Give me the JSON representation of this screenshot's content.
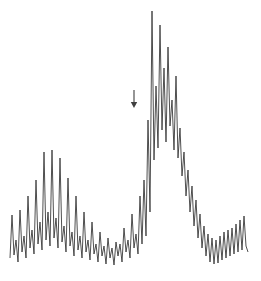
{
  "figure": {
    "title": "",
    "background_color": "#ffffff",
    "trace_color": "#3b3b3b",
    "annotation_color": "#3f3f3f",
    "width": 261,
    "height": 281
  },
  "annotations": [
    {
      "name": "peak-marker-arrow",
      "symbol": "down-arrow",
      "label": "",
      "x": 134,
      "y_top": 90,
      "y_bottom": 108
    }
  ],
  "chart_data": {
    "type": "line",
    "title": "",
    "subtitle": "",
    "xlabel": "",
    "ylabel": "",
    "legend": [],
    "legend_position": "none",
    "grid": false,
    "axis_visible": false,
    "xlim": [
      0,
      260
    ],
    "ylim": [
      0,
      281
    ],
    "x": [
      10,
      12,
      14,
      16,
      18,
      20,
      22,
      24,
      26,
      28,
      30,
      32,
      34,
      36,
      38,
      40,
      42,
      44,
      46,
      48,
      50,
      52,
      54,
      56,
      58,
      60,
      62,
      64,
      66,
      68,
      70,
      72,
      74,
      76,
      78,
      80,
      82,
      84,
      86,
      88,
      90,
      92,
      94,
      96,
      98,
      100,
      102,
      104,
      106,
      108,
      110,
      112,
      114,
      116,
      118,
      120,
      122,
      124,
      126,
      128,
      130,
      132,
      134,
      136,
      138,
      140,
      142,
      144,
      146,
      148,
      150,
      152,
      154,
      156,
      158,
      160,
      162,
      164,
      166,
      168,
      170,
      172,
      174,
      176,
      178,
      180,
      182,
      184,
      186,
      188,
      190,
      192,
      194,
      196,
      198,
      200,
      202,
      204,
      206,
      208,
      210,
      212,
      214,
      216,
      218,
      220,
      222,
      224,
      226,
      228,
      230,
      232,
      234,
      236,
      238,
      240,
      242,
      244,
      246,
      248
    ],
    "y": [
      258,
      215,
      255,
      240,
      262,
      210,
      252,
      236,
      258,
      196,
      248,
      230,
      254,
      180,
      244,
      222,
      250,
      152,
      240,
      212,
      246,
      150,
      238,
      218,
      248,
      158,
      242,
      226,
      252,
      178,
      246,
      232,
      256,
      196,
      250,
      236,
      258,
      212,
      252,
      240,
      260,
      222,
      254,
      244,
      262,
      232,
      256,
      246,
      264,
      238,
      258,
      248,
      265,
      242,
      256,
      244,
      262,
      228,
      252,
      240,
      258,
      214,
      248,
      234,
      254,
      196,
      244,
      180,
      236,
      120,
      212,
      11,
      160,
      86,
      148,
      25,
      130,
      68,
      142,
      47,
      126,
      100,
      150,
      76,
      158,
      128,
      176,
      152,
      196,
      170,
      212,
      186,
      226,
      200,
      238,
      214,
      248,
      226,
      256,
      234,
      262,
      238,
      264,
      240,
      263,
      236,
      260,
      232,
      258,
      230,
      256,
      228,
      254,
      224,
      252,
      220,
      250,
      216,
      246,
      252
    ],
    "envelope_upper": {
      "description": "Peak tops (local maxima of the trace, as pixel y-values)",
      "x": [
        20,
        28,
        36,
        44,
        52,
        60,
        68,
        76,
        84,
        92,
        100,
        108,
        116,
        124,
        132,
        140,
        148,
        152,
        160,
        168,
        176,
        184,
        192,
        200,
        208,
        216,
        224,
        232,
        240,
        248
      ],
      "y": [
        210,
        196,
        180,
        152,
        150,
        158,
        178,
        196,
        212,
        222,
        232,
        238,
        242,
        228,
        214,
        196,
        120,
        11,
        25,
        47,
        100,
        152,
        186,
        214,
        234,
        240,
        232,
        228,
        220,
        216
      ]
    },
    "envelope_lower": {
      "description": "Valley bottoms (local minima of the trace, as pixel y-values)",
      "x": [
        18,
        26,
        34,
        42,
        50,
        58,
        66,
        74,
        82,
        90,
        98,
        106,
        114,
        122,
        130,
        138,
        146,
        154,
        162,
        170,
        178,
        186,
        194,
        202,
        210,
        218,
        226,
        234,
        242,
        248
      ],
      "y": [
        262,
        258,
        254,
        250,
        246,
        248,
        252,
        256,
        258,
        260,
        262,
        264,
        265,
        262,
        258,
        254,
        236,
        160,
        130,
        126,
        158,
        196,
        226,
        248,
        262,
        263,
        260,
        258,
        256,
        252
      ]
    },
    "features": [
      {
        "name": "left-hump",
        "center_x": 46,
        "peak_y": 150,
        "label": ""
      },
      {
        "name": "central-valley",
        "center_x": 110,
        "peak_y": 264,
        "label": ""
      },
      {
        "name": "main-peak",
        "center_x": 152,
        "peak_y": 11,
        "label": ""
      },
      {
        "name": "second-peak",
        "center_x": 160,
        "peak_y": 25,
        "label": ""
      },
      {
        "name": "third-peak",
        "center_x": 168,
        "peak_y": 47,
        "label": ""
      },
      {
        "name": "right-tail",
        "center_x": 220,
        "peak_y": 232,
        "label": ""
      }
    ]
  }
}
